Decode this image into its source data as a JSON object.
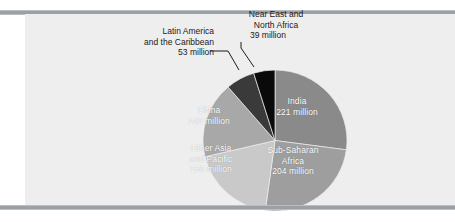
{
  "figure": {
    "background": "#ffffff",
    "panel_color": "#eeeeee",
    "rule_color": "#9aa0a6"
  },
  "chart_data": {
    "type": "pie",
    "title": "",
    "unit": "million",
    "total": 815,
    "start_angle_deg": 0,
    "direction": "clockwise",
    "legend": "none",
    "labels_inside": true,
    "categories": [
      "India",
      "Sub-Saharan Africa",
      "Other Asia and Pacific",
      "China",
      "Latin America and the Caribbean",
      "Near East and North Africa"
    ],
    "values": [
      221,
      204,
      156,
      142,
      53,
      39
    ],
    "colors": [
      "#8a8a8a",
      "#9e9e9e",
      "#c9c9c9",
      "#a8a8a8",
      "#3a3a3a",
      "#0a0a0a"
    ],
    "slices": [
      {
        "name": "India",
        "value": 221,
        "value_text": "221 million",
        "label_line1": "India",
        "label_line2": "221 million",
        "color": "#8a8a8a",
        "label_placement": "inside",
        "text_color": "#ffffff",
        "start_deg": 0.0,
        "sweep_deg": 97.6
      },
      {
        "name": "Sub-Saharan Africa",
        "value": 204,
        "value_text": "204 million",
        "label_line1": "Sub-Saharan",
        "label_line2": "Africa",
        "label_line3": "204 million",
        "color": "#9e9e9e",
        "label_placement": "inside",
        "text_color": "#ffffff",
        "start_deg": 97.6,
        "sweep_deg": 90.1
      },
      {
        "name": "Other Asia and Pacific",
        "value": 156,
        "value_text": "156 million",
        "label_line1": "Other Asia",
        "label_line2": "and Pacific",
        "label_line3": "156 million",
        "color": "#c9c9c9",
        "label_placement": "inside",
        "text_color": "#ffffff",
        "start_deg": 187.7,
        "sweep_deg": 68.9
      },
      {
        "name": "China",
        "value": 142,
        "value_text": "142 million",
        "label_line1": "China",
        "label_line2": "142 million",
        "color": "#a8a8a8",
        "label_placement": "inside",
        "text_color": "#ffffff",
        "start_deg": 256.6,
        "sweep_deg": 62.7
      },
      {
        "name": "Latin America and the Caribbean",
        "value": 53,
        "value_text": "53 million",
        "label_line1": "Latin America",
        "label_line2": "and the Caribbean",
        "label_line3": "53 million",
        "color": "#3a3a3a",
        "label_placement": "outside",
        "text_color": "#1a1a1a",
        "start_deg": 319.3,
        "sweep_deg": 23.4
      },
      {
        "name": "Near East and North Africa",
        "value": 39,
        "value_text": "39 million",
        "label_line1": "Near East and",
        "label_line2": "North Africa",
        "label_line3": "39 million",
        "color": "#0a0a0a",
        "label_placement": "outside",
        "text_color": "#1a1a1a",
        "start_deg": 342.7,
        "sweep_deg": 17.2
      }
    ]
  }
}
